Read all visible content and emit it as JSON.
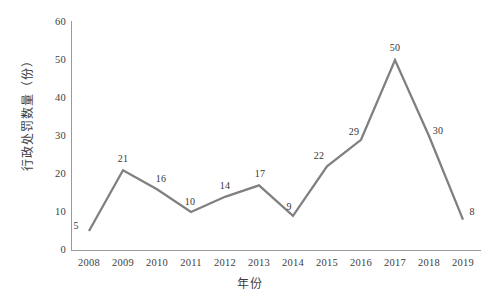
{
  "chart_data": {
    "type": "line",
    "title": "",
    "xlabel": "年份",
    "ylabel": "行政处罚数量（份）",
    "categories": [
      "2008",
      "2009",
      "2010",
      "2011",
      "2012",
      "2013",
      "2014",
      "2015",
      "2016",
      "2017",
      "2018",
      "2019"
    ],
    "values": [
      5,
      21,
      16,
      10,
      14,
      17,
      9,
      22,
      29,
      50,
      30,
      8
    ],
    "point_labels": [
      "5",
      "21",
      "16",
      "10",
      "14",
      "17",
      "9",
      "22",
      "29",
      "50",
      "30",
      "8"
    ],
    "series": [
      {
        "name": "行政处罚数量",
        "values": [
          5,
          21,
          16,
          10,
          14,
          17,
          9,
          22,
          29,
          50,
          30,
          8
        ],
        "color": "#808080"
      }
    ],
    "ylim": [
      0,
      60
    ],
    "yticks": [
      0,
      10,
      20,
      30,
      40,
      50,
      60
    ],
    "ytick_labels": [
      "0",
      "10",
      "20",
      "30",
      "40",
      "50",
      "60"
    ],
    "grid": false,
    "legend": "none",
    "line_color": "#808080",
    "axis_color": "#9a9a9a",
    "background": "#ffffff",
    "markers": "none"
  }
}
